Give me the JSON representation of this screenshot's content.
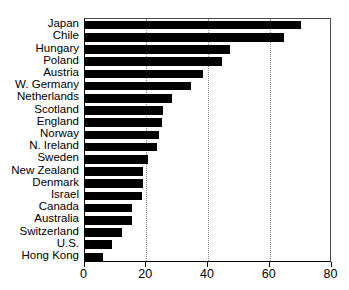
{
  "chart_data": {
    "type": "bar",
    "orientation": "horizontal",
    "title": "",
    "subtitle": "",
    "xlabel": "",
    "ylabel": "",
    "xlim": [
      0,
      80
    ],
    "xticks": [
      "0",
      "20",
      "40",
      "60",
      "80"
    ],
    "xtick_values": [
      0,
      20,
      40,
      60,
      80
    ],
    "grid": "vertical dotted gridlines at 20, 40, 60",
    "legend": "none",
    "bar_color": "#000000",
    "background_color": "#ffffff",
    "categories": [
      "Japan",
      "Chile",
      "Hungary",
      "Poland",
      "Austria",
      "W. Germany",
      "Netherlands",
      "Scotland",
      "England",
      "Norway",
      "N. Ireland",
      "Sweden",
      "New Zealand",
      "Denmark",
      "Israel",
      "Canada",
      "Australia",
      "Switzerland",
      "U.S.",
      "Hong Kong"
    ],
    "values": [
      70,
      64.5,
      47,
      44.5,
      38.5,
      34.5,
      28.5,
      25.5,
      25,
      24,
      23.5,
      20.5,
      19,
      19,
      18.5,
      15.5,
      15.5,
      12,
      9,
      6
    ]
  }
}
